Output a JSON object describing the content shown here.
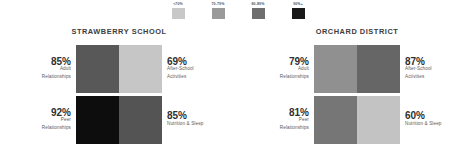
{
  "legend": {
    "items": [
      {
        "label": "<70%",
        "color": "#c8c8c8",
        "name": "legend-swatch-under-70"
      },
      {
        "label": "70-79%",
        "color": "#9a9a9a",
        "name": "legend-swatch-70-79"
      },
      {
        "label": "80-89%",
        "color": "#6e6e6e",
        "name": "legend-swatch-80-89"
      },
      {
        "label": "90%+",
        "color": "#1a1a1a",
        "name": "legend-swatch-90-plus"
      }
    ]
  },
  "panels": [
    {
      "title": "STRAWBERRY SCHOOL",
      "cells": [
        {
          "value": "85%",
          "category": "Adult Relationships",
          "lines": [
            "Adult",
            "Relationships"
          ],
          "color": "#585858",
          "side": "left"
        },
        {
          "value": "69%",
          "category": "After-School Activities",
          "lines": [
            "After-School",
            "Activities"
          ],
          "color": "#c6c6c6",
          "side": "right"
        },
        {
          "value": "92%",
          "category": "Peer Relationships",
          "lines": [
            "Peer",
            "Relationships"
          ],
          "color": "#0d0d0d",
          "side": "left"
        },
        {
          "value": "85%",
          "category": "Nutrition & Sleep",
          "lines": [
            "Nutrition & Sleep"
          ],
          "color": "#545454",
          "side": "right"
        }
      ]
    },
    {
      "title": "ORCHARD DISTRICT",
      "cells": [
        {
          "value": "79%",
          "category": "Adult Relationships",
          "lines": [
            "Adult",
            "Relationships"
          ],
          "color": "#909090",
          "side": "left"
        },
        {
          "value": "87%",
          "category": "After-School Activities",
          "lines": [
            "After-School",
            "Activities"
          ],
          "color": "#666666",
          "side": "right"
        },
        {
          "value": "81%",
          "category": "Peer Relationships",
          "lines": [
            "Peer",
            "Relationships"
          ],
          "color": "#767676",
          "side": "left"
        },
        {
          "value": "60%",
          "category": "Nutrition & Sleep",
          "lines": [
            "Nutrition & Sleep"
          ],
          "color": "#c3c3c3",
          "side": "right"
        }
      ]
    }
  ],
  "chart_data": {
    "type": "heatmap",
    "title": "",
    "xlabel": "",
    "ylabel": "",
    "grid": false,
    "legend_position": "top-center",
    "legend_title": "",
    "color_scale": {
      "kind": "binned-grayscale",
      "bins": [
        {
          "label": "<70%",
          "range": [
            0,
            69
          ],
          "color": "#c8c8c8"
        },
        {
          "label": "70-79%",
          "range": [
            70,
            79
          ],
          "color": "#9a9a9a"
        },
        {
          "label": "80-89%",
          "range": [
            80,
            89
          ],
          "color": "#6e6e6e"
        },
        {
          "label": "90%+",
          "range": [
            90,
            100
          ],
          "color": "#1a1a1a"
        }
      ]
    },
    "unit": "%",
    "groups": [
      "STRAWBERRY SCHOOL",
      "ORCHARD DISTRICT"
    ],
    "categories": [
      "Adult Relationships",
      "After-School Activities",
      "Peer Relationships",
      "Nutrition & Sleep"
    ],
    "series": [
      {
        "name": "STRAWBERRY SCHOOL",
        "values": [
          85,
          69,
          92,
          85
        ]
      },
      {
        "name": "ORCHARD DISTRICT",
        "values": [
          79,
          87,
          81,
          60
        ]
      }
    ],
    "cell_layout": {
      "rows": 2,
      "cols": 2,
      "order": [
        [
          "Adult Relationships",
          "After-School Activities"
        ],
        [
          "Peer Relationships",
          "Nutrition & Sleep"
        ]
      ]
    }
  }
}
